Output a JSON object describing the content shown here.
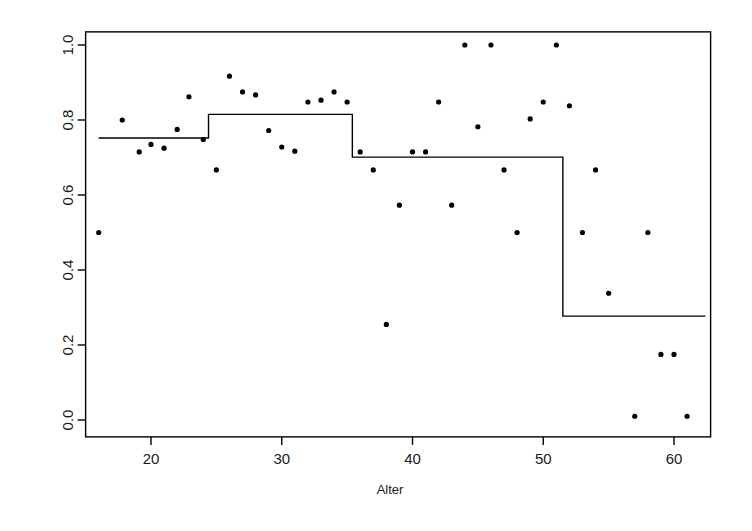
{
  "chart_data": {
    "type": "scatter",
    "title": "",
    "subtitle": "",
    "xlabel": "Alter",
    "ylabel": "",
    "xlim": [
      15.0,
      62.8
    ],
    "ylim": [
      -0.045,
      1.035
    ],
    "grid": false,
    "legend": null,
    "xticks": [
      20,
      30,
      40,
      50,
      60
    ],
    "xtick_labels": [
      "20",
      "30",
      "40",
      "50",
      "60"
    ],
    "yticks": [
      0.0,
      0.2,
      0.4,
      0.6,
      0.8,
      1.0
    ],
    "ytick_labels": [
      "0.0",
      "0.2",
      "0.4",
      "0.6",
      "0.8",
      "1.0"
    ],
    "point_color": "#000000",
    "line_color": "#000000",
    "box_color": "#000000",
    "series": [
      {
        "name": "observations",
        "type": "scatter",
        "marker": "filled-circle",
        "x": [
          16.0,
          17.8,
          19.1,
          20.0,
          21.0,
          22.0,
          22.9,
          24.0,
          25.0,
          26.0,
          27.0,
          28.0,
          29.0,
          30.0,
          31.0,
          32.0,
          33.0,
          34.0,
          35.0,
          36.0,
          37.0,
          38.0,
          39.0,
          40.0,
          41.0,
          42.0,
          43.0,
          44.0,
          45.0,
          46.0,
          47.0,
          48.0,
          49.0,
          50.0,
          51.0,
          52.0,
          53.0,
          54.0,
          55.0,
          57.0,
          58.0,
          59.0,
          60.0,
          61.0
        ],
        "y": [
          0.5,
          0.8,
          0.715,
          0.735,
          0.725,
          0.775,
          0.862,
          0.748,
          0.667,
          0.917,
          0.875,
          0.867,
          0.772,
          0.728,
          0.717,
          0.848,
          0.853,
          0.875,
          0.848,
          0.715,
          0.667,
          0.255,
          0.573,
          0.715,
          0.715,
          0.848,
          0.573,
          1.0,
          0.782,
          1.0,
          0.667,
          0.5,
          0.803,
          0.848,
          1.0,
          0.838,
          0.5,
          0.667,
          0.338,
          0.01,
          0.5,
          0.175,
          0.175,
          0.01
        ]
      },
      {
        "name": "step-fit",
        "type": "step",
        "breakpoints": [
          16.0,
          24.4,
          35.4,
          51.5,
          62.4
        ],
        "levels": [
          0.752,
          0.815,
          0.701,
          0.277
        ]
      }
    ]
  }
}
